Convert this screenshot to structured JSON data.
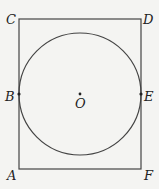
{
  "diagram": {
    "type": "geometry",
    "rectangle": {
      "x": 19,
      "y": 19,
      "width": 122,
      "height": 150,
      "stroke": "#444444"
    },
    "circle": {
      "cx": 80,
      "cy": 94,
      "r": 61,
      "stroke": "#444444"
    },
    "labels": {
      "A": "A",
      "B": "B",
      "C": "C",
      "D": "D",
      "E": "E",
      "F": "F",
      "O": "O"
    },
    "points": {
      "B": {
        "x": 19,
        "y": 94
      },
      "E": {
        "x": 141,
        "y": 94
      },
      "O": {
        "x": 80,
        "y": 94
      }
    }
  }
}
